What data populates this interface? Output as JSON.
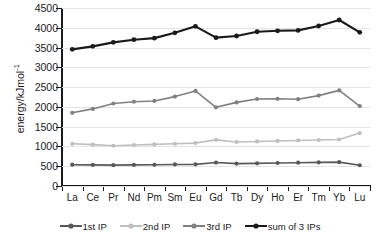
{
  "chart_data": {
    "type": "line",
    "title": "",
    "xlabel": "",
    "ylabel": "energy/kJmol",
    "ylabel_sup": "-1",
    "ylim": [
      0,
      4500
    ],
    "ytick_step": 500,
    "yticks": [
      "0",
      "500",
      "1000",
      "1500",
      "2000",
      "2500",
      "3000",
      "3500",
      "4000",
      "4500"
    ],
    "grid": true,
    "legend_position": "bottom",
    "categories": [
      "La",
      "Ce",
      "Pr",
      "Nd",
      "Pm",
      "Sm",
      "Eu",
      "Gd",
      "Tb",
      "Dy",
      "Ho",
      "Er",
      "Tm",
      "Yb",
      "Lu"
    ],
    "series": [
      {
        "name": "1st IP",
        "color": "#595959",
        "values": [
          538,
          534,
          527,
          533,
          536,
          545,
          547,
          593,
          566,
          573,
          581,
          589,
          597,
          603,
          524
        ]
      },
      {
        "name": "2nd IP",
        "color": "#bfbfbf",
        "values": [
          1067,
          1047,
          1018,
          1035,
          1052,
          1068,
          1085,
          1167,
          1112,
          1126,
          1139,
          1151,
          1163,
          1176,
          1340
        ]
      },
      {
        "name": "3rd IP",
        "color": "#808080",
        "values": [
          1850,
          1949,
          2086,
          2130,
          2150,
          2260,
          2404,
          1990,
          2114,
          2200,
          2204,
          2194,
          2285,
          2417,
          2022
        ]
      },
      {
        "name": "sum of 3 IPs",
        "color": "#1a1a1a",
        "values": [
          3455,
          3530,
          3631,
          3698,
          3738,
          3873,
          4036,
          3750,
          3792,
          3899,
          3924,
          3934,
          4045,
          4196,
          3886
        ]
      }
    ]
  },
  "caption": {
    "text": ""
  }
}
